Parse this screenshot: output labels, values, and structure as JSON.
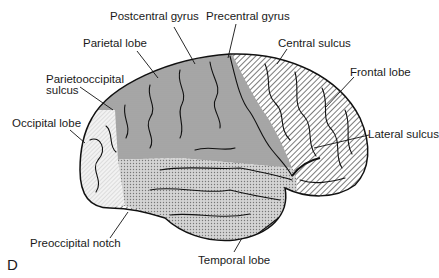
{
  "figure": {
    "panel_letter": "D",
    "labels": {
      "postcentral_gyrus": "Postcentral gyrus",
      "precentral_gyrus": "Precentral gyrus",
      "parietal_lobe": "Parietal lobe",
      "central_sulcus": "Central sulcus",
      "parietooccipital_sulcus_line1": "Parietooccipital",
      "parietooccipital_sulcus_line2": "sulcus",
      "frontal_lobe": "Frontal lobe",
      "occipital_lobe": "Occipital lobe",
      "lateral_sulcus": "Lateral sulcus",
      "preoccipital_notch": "Preoccipital notch",
      "temporal_lobe": "Temporal lobe"
    },
    "colors": {
      "outline": "#111111",
      "parietal_fill": "#a8a8a8",
      "frontal_hatch": "#333333",
      "temporal_fill": "#c9c9c9",
      "occipital_fill": "#e6e6e6",
      "background": "#ffffff"
    }
  }
}
